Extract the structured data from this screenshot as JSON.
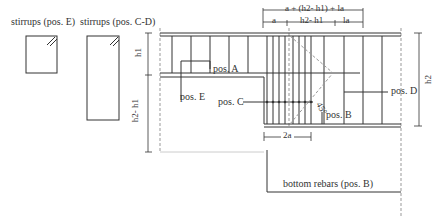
{
  "labels": {
    "stirrups_e": "stirrups (pos. E)",
    "stirrups_cd": "stirrups (pos. C-D)",
    "pos_a": "pos. A",
    "pos_b": "pos. B",
    "pos_c": "pos. C",
    "pos_d": "pos. D",
    "pos_e": "pos. E",
    "bottom_rebars": "bottom rebars (pos. B)",
    "angle": "45°"
  },
  "dimensions": {
    "top_total": "a + (h2- h1) + la",
    "top_a": "a",
    "top_h2h1": "h2- h1",
    "top_la": "la",
    "left_h1": "h1",
    "left_h2h1": "h2- h1",
    "right_h2": "h2",
    "bottom_2a": "2a"
  },
  "colors": {
    "line": "#333333",
    "dashed": "#999999"
  }
}
